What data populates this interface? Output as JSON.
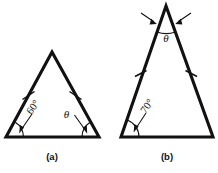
{
  "figure": {
    "background_color": "#ffffff",
    "line_color": "#111111",
    "panels": [
      {
        "id": "a",
        "caption": "(a)",
        "shape": "triangle",
        "description": "Isosceles triangle with two tick-marked equal sides",
        "base_angle_left_label": "60°",
        "base_angle_right_label": "θ",
        "tick_marks": 2,
        "vertices": {
          "apex": [
            52,
            52
          ],
          "base_left": [
            6,
            137
          ],
          "base_right": [
            99,
            137
          ]
        }
      },
      {
        "id": "b",
        "caption": "(b)",
        "shape": "triangle",
        "description": "Tall isosceles triangle with two tick-marked equal sides and apex angle theta",
        "base_angle_left_label": "70°",
        "apex_angle_label": "θ",
        "tick_marks": 2,
        "vertices": {
          "apex": [
            166,
            6
          ],
          "base_left": [
            121,
            137
          ],
          "base_right": [
            213,
            137
          ]
        }
      }
    ],
    "labels": {
      "angle_60": "60°",
      "angle_70": "70°",
      "theta_a": "θ",
      "theta_b": "θ",
      "caption_a": "(a)",
      "caption_b": "(b)"
    }
  }
}
